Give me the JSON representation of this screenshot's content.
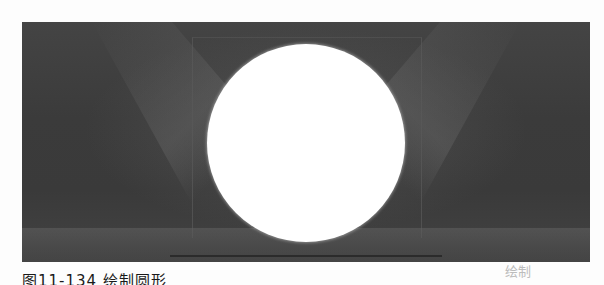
{
  "figure": {
    "background_color": "#3e3e3e",
    "shape": "circle",
    "shape_color": "#ffffff"
  },
  "caption": {
    "text": "图11-134 绘制圆形",
    "right_text": "绘制"
  }
}
